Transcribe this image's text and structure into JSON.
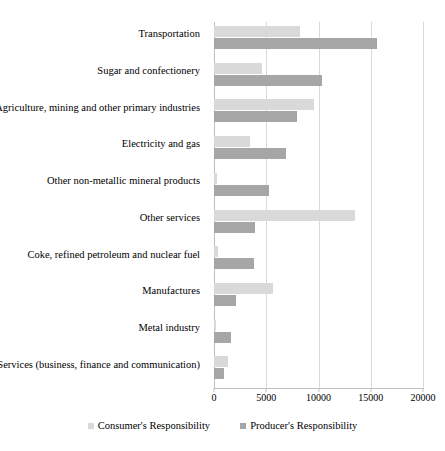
{
  "chart_data": {
    "type": "bar",
    "orientation": "horizontal",
    "title": "",
    "xlabel": "",
    "ylabel": "",
    "xlim": [
      0,
      20000
    ],
    "xticks": [
      0,
      5000,
      10000,
      15000,
      20000
    ],
    "xtick_labels": [
      "0",
      "5000",
      "10000",
      "15000",
      "20000"
    ],
    "grid": true,
    "grid_axis": "x",
    "legend_position": "bottom",
    "categories": [
      "Transportation",
      "Sugar and confectionery",
      "Agriculture, mining and other primary industries",
      "Electricity and gas",
      "Other non-metallic mineral products",
      "Other services",
      "Coke, refined petroleum and nuclear fuel",
      "Manufactures",
      "Metal industry",
      "Services (business, finance and communication)"
    ],
    "series": [
      {
        "name": "Consumer's Responsibility",
        "color": "#d9d9d9",
        "values": [
          8200,
          4600,
          9550,
          3450,
          300,
          13500,
          350,
          5650,
          200,
          1350
        ]
      },
      {
        "name": "Producer's Responsibility",
        "color": "#a6a6a6",
        "values": [
          15600,
          10300,
          7900,
          6900,
          5250,
          3900,
          3800,
          2100,
          1600,
          950
        ]
      }
    ]
  },
  "legend": {
    "items": [
      {
        "label": "Consumer's Responsibility",
        "swatch": "consumer"
      },
      {
        "label": "Producer's Responsibility",
        "swatch": "producer"
      }
    ]
  }
}
